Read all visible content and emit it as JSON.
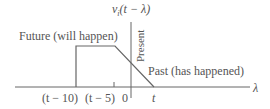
{
  "diagram": {
    "ylabel_fn": "v",
    "ylabel_sub": "i",
    "ylabel_arg": "(t − λ)",
    "xaxis_label": "λ",
    "region_future": "Future (will happen)",
    "region_present": "Present",
    "region_past": "Past (has happened)",
    "ticks": [
      {
        "label": "(t − 10)",
        "x": 76
      },
      {
        "label": "(t − 5)",
        "x": 114
      },
      {
        "label": "0",
        "x": 131
      },
      {
        "label": "t",
        "x": 154
      }
    ],
    "waveform_points": [
      [
        76,
        87
      ],
      [
        76,
        46
      ],
      [
        115,
        46
      ],
      [
        154,
        87
      ]
    ],
    "colors": {
      "line": "#666666",
      "text": "#555555"
    }
  }
}
